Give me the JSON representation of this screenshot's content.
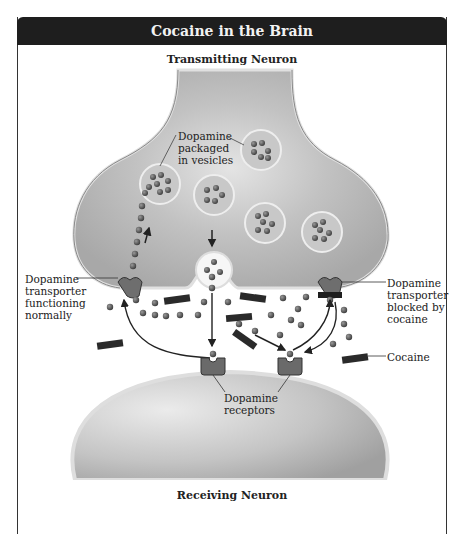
{
  "title": "Cocaine in the Brain",
  "labels": {
    "transmitting_neuron": "Transmitting Neuron",
    "receiving_neuron": "Receiving Neuron",
    "vesicles": [
      "Dopamine",
      "packaged",
      "in vesicles"
    ],
    "transporter_normal": [
      "Dopamine",
      "transporter",
      "functioning",
      "normally"
    ],
    "transporter_blocked": [
      "Dopamine",
      "transporter",
      "blocked by",
      "cocaine"
    ],
    "cocaine": "Cocaine",
    "receptors": [
      "Dopamine",
      "receptors"
    ]
  },
  "colors": {
    "title_bar": "#1e1e1e",
    "neuron_fill": "#b4b4b4",
    "neuron_edge": "#dcdcdc",
    "dopamine": "#555555",
    "cocaine": "#2a2a2a",
    "transporter": "#6e6e6e"
  }
}
